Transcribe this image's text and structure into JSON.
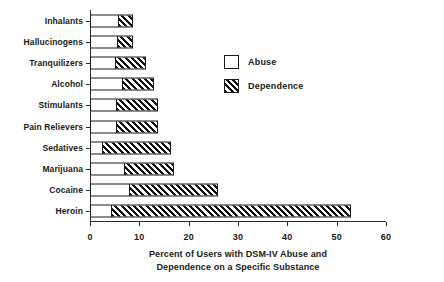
{
  "chart_data": {
    "type": "bar",
    "orientation": "horizontal",
    "stacked": true,
    "title": "",
    "xlabel_line1": "Percent of Users with DSM-IV Abuse  and",
    "xlabel_line2": "Dependence on a Specific Substance",
    "ylabel": "",
    "categories": [
      "Inhalants",
      "Hallucinogens",
      "Tranquilizers",
      "Alcohol",
      "Stimulants",
      "Pain Relievers",
      "Sedatives",
      "Marijuana",
      "Cocaine",
      "Heroin"
    ],
    "series": [
      {
        "name": "Abuse",
        "fill": "white",
        "values": [
          5.6,
          5.5,
          5.1,
          6.4,
          5.3,
          5.3,
          2.5,
          6.8,
          7.9,
          4.2
        ]
      },
      {
        "name": "Dependence",
        "fill": "hatched",
        "values": [
          3.2,
          3.3,
          6.2,
          6.6,
          8.5,
          8.5,
          14.0,
          10.2,
          18.1,
          48.8
        ]
      }
    ],
    "totals": [
      8.8,
      8.8,
      11.3,
      13.0,
      13.8,
      13.8,
      16.5,
      17.0,
      26.0,
      53.0
    ],
    "xlim": [
      0,
      60
    ],
    "xticks": [
      0,
      10,
      20,
      30,
      40,
      50,
      60
    ],
    "xticklabels": [
      "0",
      "10",
      "20",
      "30",
      "40",
      "50",
      "60"
    ],
    "grid": false,
    "legend_position": "center-right",
    "legend": [
      "Abuse",
      "Dependence"
    ]
  }
}
